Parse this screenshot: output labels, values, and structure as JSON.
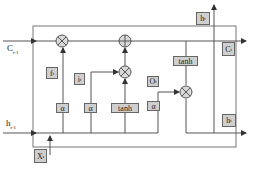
{
  "diagram": {
    "type": "LSTM cell",
    "inputs": {
      "c_prev": {
        "base": "C",
        "sub": "t-1"
      },
      "h_prev": {
        "base": "h",
        "sub": "t-1"
      },
      "x": {
        "base": "X",
        "sub": "t"
      }
    },
    "outputs": {
      "h_top": {
        "base": "h",
        "sub": "t"
      },
      "c": {
        "base": "C",
        "sub": "t"
      },
      "h_bottom": {
        "base": "h",
        "sub": "t"
      }
    },
    "gates": {
      "forget": {
        "base": "f",
        "sub": "t"
      },
      "input": {
        "base": "i",
        "sub": "t"
      },
      "output": {
        "base": "O",
        "sub": "t"
      }
    },
    "activations": {
      "sigma1": "α",
      "sigma2": "α",
      "tanh_mid": "tanh",
      "sigma3": "α",
      "tanh_top": "tanh"
    },
    "operators": {
      "mul": "⊗",
      "add": "⊕"
    },
    "colors": {
      "line": "#555555",
      "box_fill": "#cfcfcf",
      "op_fill": "#d8d8d8"
    }
  }
}
